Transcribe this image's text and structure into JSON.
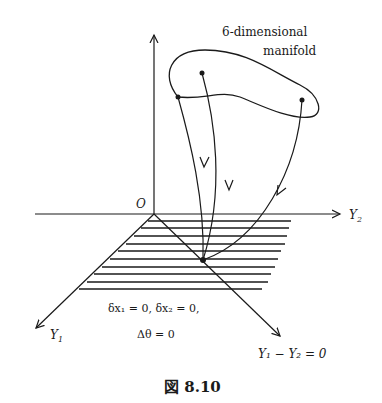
{
  "figure": {
    "caption": "図 8.10",
    "manifold_label_line1": "6-dimensional",
    "manifold_label_line2": "manifold",
    "origin_label": "O",
    "axis_y2_label": "Y",
    "axis_y2_sub": "2",
    "axis_y1_label": "Y",
    "axis_y1_sub": "1",
    "diagonal_label": "Y₁ − Y₂ = 0",
    "condition_line1": "δx₁ = 0,   δx₂ = 0,",
    "condition_line2": "Δθ = 0"
  }
}
